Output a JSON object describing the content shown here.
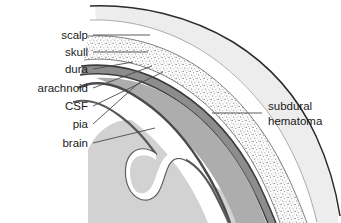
{
  "figure": {
    "background": "#ffffff"
  },
  "labels": {
    "left": [
      {
        "id": "scalp",
        "text": "scalp"
      },
      {
        "id": "skull",
        "text": "skull"
      },
      {
        "id": "dura",
        "text": "dura"
      },
      {
        "id": "arachnoid",
        "text": "arachnoid"
      },
      {
        "id": "csf",
        "text": "CSF"
      },
      {
        "id": "pia",
        "text": "pia"
      },
      {
        "id": "brain",
        "text": "brain"
      }
    ],
    "right": [
      {
        "id": "subdural-hematoma-line1",
        "text": "subdural"
      },
      {
        "id": "subdural-hematoma-line2",
        "text": "hematoma"
      }
    ]
  },
  "colors": {
    "scalp_fill": "#ededed",
    "skull_fill": "#fbfbfb",
    "skull_stipple": "#6e6e6e",
    "dura_line": "#3c3c3c",
    "arachnoid_line": "#3c3c3c",
    "csf_fill": "#ffffff",
    "hematoma_fill": "#adadad",
    "brain_fill": "#d2d2d2",
    "pia_line": "#666666",
    "outline": "#222222",
    "leader_line": "#4a4a4a",
    "label_text": "#1a1a1a"
  }
}
